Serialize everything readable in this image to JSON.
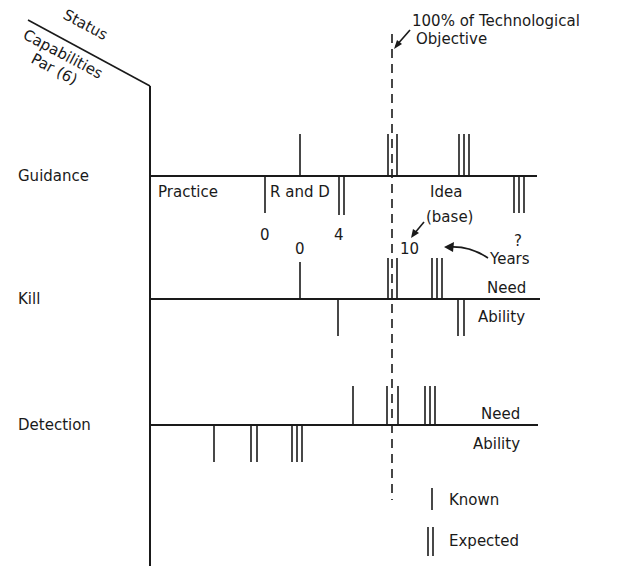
{
  "corner_header": {
    "status": "Status",
    "capabilities": "Capabilities",
    "par": "Par (6)"
  },
  "objective_label": {
    "line1": "100% of Technological",
    "line2": "Objective"
  },
  "rows": [
    {
      "name": "Guidance",
      "y": 176
    },
    {
      "name": "Kill",
      "y": 299
    },
    {
      "name": "Detection",
      "y": 425
    }
  ],
  "guidance": {
    "phases": [
      "Practice",
      "R and D",
      "Idea"
    ],
    "base_note": "(base)",
    "year_marks": [
      "0",
      "4",
      "10",
      "?"
    ],
    "kill_zero_mark": "0",
    "years_label": "Years"
  },
  "kill": {
    "need_label": "Need",
    "ability_label": "Ability"
  },
  "detection": {
    "need_label": "Need",
    "ability_label": "Ability"
  },
  "legend": {
    "known": "Known",
    "expected": "Expected"
  },
  "colors": {
    "ink": "#1a1a1a",
    "background": "#ffffff"
  }
}
